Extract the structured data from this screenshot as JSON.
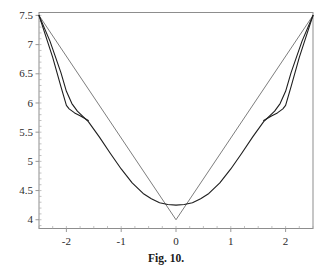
{
  "caption": "Fig. 10.",
  "chart_data": {
    "type": "line",
    "title": "Fig. 10.",
    "xlabel": "",
    "ylabel": "",
    "grid": false,
    "legend": "none",
    "xlim": [
      -2.5,
      2.5
    ],
    "ylim": [
      3.85,
      7.55
    ],
    "xticks": [
      -2,
      -1,
      0,
      1,
      2
    ],
    "xticklabels": [
      "-2",
      "-1",
      "0",
      "1",
      "2"
    ],
    "yticks": [
      4,
      4.5,
      5,
      5.5,
      6,
      6.5,
      7,
      7.5
    ],
    "yticklabels": [
      "4",
      "4.5",
      "5",
      "5.5",
      "6",
      "6.5",
      "7",
      "7.5"
    ],
    "x_minor_tick_step": 0.25,
    "y_minor_tick_step": 0.1,
    "series": [
      {
        "name": "piecewise-linear-v",
        "color": "#6e6e6e",
        "x": [
          -2.5,
          0,
          2.5
        ],
        "y": [
          7.5,
          4.0,
          7.5
        ]
      },
      {
        "name": "smooth-curve",
        "color": "#1e1e1e",
        "x": [
          -2.5,
          -2.3,
          -2.1,
          -2.0,
          -1.9,
          -1.8,
          -1.6,
          -1.4,
          -1.2,
          -1.0,
          -0.8,
          -0.6,
          -0.45,
          -0.3,
          -0.15,
          0.0,
          0.15,
          0.3,
          0.45,
          0.6,
          0.8,
          1.0,
          1.2,
          1.4,
          1.6,
          1.8,
          1.9,
          2.0,
          2.1,
          2.3,
          2.5
        ],
        "y": [
          7.5,
          7.06,
          6.52,
          6.2,
          5.99,
          5.86,
          5.68,
          5.42,
          5.14,
          4.87,
          4.63,
          4.45,
          4.36,
          4.29,
          4.26,
          4.25,
          4.26,
          4.29,
          4.36,
          4.45,
          4.63,
          4.87,
          5.14,
          5.42,
          5.68,
          5.86,
          5.99,
          6.2,
          6.52,
          7.06,
          7.5
        ]
      },
      {
        "name": "secondary-branch-left",
        "color": "#1e1e1e",
        "x": [
          -2.5,
          -2.25,
          -2.1,
          -2.0,
          -1.95,
          -1.85,
          -1.75,
          -1.6
        ],
        "y": [
          7.5,
          6.78,
          6.28,
          5.96,
          5.9,
          5.83,
          5.78,
          5.7
        ]
      },
      {
        "name": "secondary-branch-right",
        "color": "#1e1e1e",
        "x": [
          1.6,
          1.75,
          1.85,
          1.95,
          2.0,
          2.1,
          2.25,
          2.5
        ],
        "y": [
          5.7,
          5.78,
          5.83,
          5.9,
          5.96,
          6.28,
          6.78,
          7.5
        ]
      }
    ],
    "annotations": [
      {
        "name": "v-vertex",
        "x": 0,
        "y": 4.0
      },
      {
        "name": "smooth-minimum",
        "x": 0,
        "y": 4.25
      },
      {
        "name": "left-kink",
        "x": -2.0,
        "y": 5.95
      },
      {
        "name": "right-kink",
        "x": 2.0,
        "y": 5.95
      }
    ]
  },
  "colors": {
    "background": "#ffffff",
    "frame": "#8d8d8d",
    "linear_curve": "#6e6e6e",
    "smooth_curve": "#1e1e1e",
    "tick_label": "#2b2b2b",
    "caption": "#1a1a1a"
  }
}
